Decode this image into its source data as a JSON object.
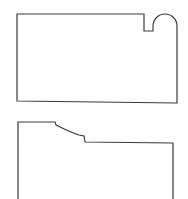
{
  "diagram": {
    "background": "#ffffff",
    "stroke_color": "#3a3a3a",
    "shapes": [
      {
        "name": "upper-part-profile",
        "description": "Rectangular outline with a rectangular notch and a rounded lobe at the top-right corner",
        "path": "M17,101 L17,14 L144,14 L144,31 L153,31 L153,26 A12,12 0 0 1 177,26 L177,103 Z"
      },
      {
        "name": "lower-part-profile",
        "description": "Outline with a stepped, sloped shoulder along the top edge; open at the bottom",
        "path": "M18,199 L18,122 L55,122 L56,125 C64,129 72,133 79,135 L84,136 L85,142 L173,143 L173,199"
      }
    ]
  }
}
